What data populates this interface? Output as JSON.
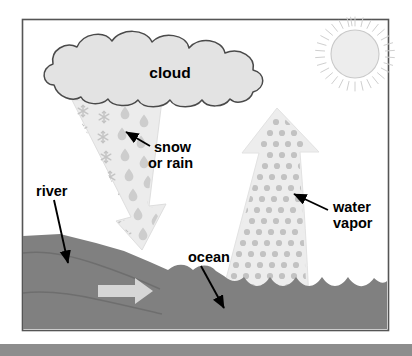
{
  "diagram": {
    "frame": {
      "x": 22,
      "y": 19,
      "width": 366,
      "height": 311,
      "border_color": "#555555",
      "background": "#ffffff"
    },
    "bottom_bar": {
      "y": 344,
      "height": 12,
      "color": "#8d8d8d"
    },
    "colors": {
      "cloud_fill": "#e3e3e3",
      "cloud_stroke": "#4a4a4a",
      "precip_fill": "#ececec",
      "precip_stroke": "#d8d8d8",
      "snowflake": "#c4c4c4",
      "raindrop": "#cdcdcd",
      "vapor_fill": "#ededed",
      "vapor_dot": "#c2c2c2",
      "sun_fill": "#ededed",
      "sun_stroke": "#c9c9c9",
      "sun_ray": "#cfcfcf",
      "land_water": "#808080",
      "land_contour": "#6e6e6e",
      "flow_arrow": "#d6d6d6",
      "label_text": "#000000",
      "pointer_arrow": "#000000"
    },
    "labels": [
      {
        "id": "cloud",
        "text": "cloud",
        "x": 170,
        "y": 74,
        "anchor": "middle",
        "size": 15,
        "lines": [
          "cloud"
        ]
      },
      {
        "id": "snow-or-rain",
        "text": "snow or rain",
        "x": 152,
        "y": 148,
        "anchor": "start",
        "size": 14,
        "lines": [
          "snow",
          "or rain"
        ]
      },
      {
        "id": "water-vapor",
        "text": "water vapor",
        "x": 330,
        "y": 208,
        "anchor": "start",
        "size": 14,
        "lines": [
          "water",
          "vapor"
        ]
      },
      {
        "id": "river",
        "text": "river",
        "x": 36,
        "y": 195,
        "anchor": "start",
        "size": 14,
        "lines": [
          "river"
        ]
      },
      {
        "id": "ocean",
        "text": "ocean",
        "x": 188,
        "y": 262,
        "anchor": "start",
        "size": 14,
        "lines": [
          "ocean"
        ]
      }
    ],
    "pointers": [
      {
        "id": "snow-or-rain-pointer",
        "from": {
          "x": 149,
          "y": 144
        },
        "to": {
          "x": 124,
          "y": 131
        }
      },
      {
        "id": "water-vapor-pointer",
        "from": {
          "x": 327,
          "y": 208
        },
        "to": {
          "x": 291,
          "y": 192
        }
      },
      {
        "id": "river-pointer",
        "from": {
          "x": 53,
          "y": 201
        },
        "to": {
          "x": 68,
          "y": 265
        }
      },
      {
        "id": "ocean-pointer",
        "from": {
          "x": 200,
          "y": 268
        },
        "to": {
          "x": 223,
          "y": 310
        }
      }
    ],
    "elements": [
      {
        "id": "cloud",
        "type": "cloud",
        "label": "cloud"
      },
      {
        "id": "sun",
        "type": "sun",
        "cx": 355,
        "cy": 57,
        "r": 24,
        "rays": 32
      },
      {
        "id": "precipitation-column",
        "type": "arrow-band",
        "label": "snow or rain",
        "direction": "down"
      },
      {
        "id": "water-vapor-column",
        "type": "arrow-band",
        "label": "water vapor",
        "direction": "up"
      },
      {
        "id": "land-mass",
        "type": "terrain",
        "label": "river"
      },
      {
        "id": "ocean-body",
        "type": "water",
        "label": "ocean"
      },
      {
        "id": "river-flow-arrow",
        "type": "flow-arrow",
        "direction": "right"
      }
    ]
  }
}
